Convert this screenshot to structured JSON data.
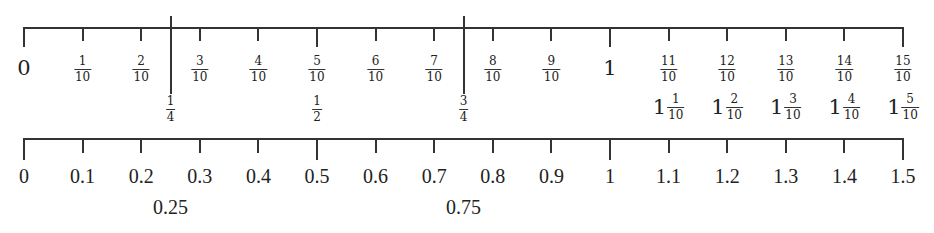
{
  "diagram": {
    "type": "number-line-comparison",
    "scale": {
      "min": 0,
      "max": 1.5,
      "x_start": 23,
      "x_end": 902
    },
    "top_line": {
      "y": 27,
      "fraction_labels": [
        {
          "value": 0,
          "whole": "0"
        },
        {
          "value": 0.1,
          "num": "1",
          "den": "10"
        },
        {
          "value": 0.2,
          "num": "2",
          "den": "10"
        },
        {
          "value": 0.3,
          "num": "3",
          "den": "10"
        },
        {
          "value": 0.4,
          "num": "4",
          "den": "10"
        },
        {
          "value": 0.5,
          "num": "5",
          "den": "10"
        },
        {
          "value": 0.6,
          "num": "6",
          "den": "10"
        },
        {
          "value": 0.7,
          "num": "7",
          "den": "10"
        },
        {
          "value": 0.8,
          "num": "8",
          "den": "10"
        },
        {
          "value": 0.9,
          "num": "9",
          "den": "10"
        },
        {
          "value": 1.0,
          "whole": "1"
        },
        {
          "value": 1.1,
          "num": "11",
          "den": "10"
        },
        {
          "value": 1.2,
          "num": "12",
          "den": "10"
        },
        {
          "value": 1.3,
          "num": "13",
          "den": "10"
        },
        {
          "value": 1.4,
          "num": "14",
          "den": "10"
        },
        {
          "value": 1.5,
          "num": "15",
          "den": "10"
        }
      ],
      "second_row_labels": [
        {
          "value": 0.25,
          "num": "1",
          "den": "4",
          "long_tick": true
        },
        {
          "value": 0.5,
          "num": "1",
          "den": "2",
          "long_tick": false
        },
        {
          "value": 0.75,
          "num": "3",
          "den": "4",
          "long_tick": true
        },
        {
          "value": 1.1,
          "whole": "1",
          "num": "1",
          "den": "10"
        },
        {
          "value": 1.2,
          "whole": "1",
          "num": "2",
          "den": "10"
        },
        {
          "value": 1.3,
          "whole": "1",
          "num": "3",
          "den": "10"
        },
        {
          "value": 1.4,
          "whole": "1",
          "num": "4",
          "den": "10"
        },
        {
          "value": 1.5,
          "whole": "1",
          "num": "5",
          "den": "10"
        }
      ]
    },
    "bottom_line": {
      "y": 138,
      "decimal_labels": [
        {
          "value": 0,
          "text": "0"
        },
        {
          "value": 0.1,
          "text": "0.1"
        },
        {
          "value": 0.2,
          "text": "0.2"
        },
        {
          "value": 0.3,
          "text": "0.3"
        },
        {
          "value": 0.4,
          "text": "0.4"
        },
        {
          "value": 0.5,
          "text": "0.5"
        },
        {
          "value": 0.6,
          "text": "0.6"
        },
        {
          "value": 0.7,
          "text": "0.7"
        },
        {
          "value": 0.8,
          "text": "0.8"
        },
        {
          "value": 0.9,
          "text": "0.9"
        },
        {
          "value": 1.0,
          "text": "1"
        },
        {
          "value": 1.1,
          "text": "1.1"
        },
        {
          "value": 1.2,
          "text": "1.2"
        },
        {
          "value": 1.3,
          "text": "1.3"
        },
        {
          "value": 1.4,
          "text": "1.4"
        },
        {
          "value": 1.5,
          "text": "1.5"
        }
      ],
      "second_row_labels": [
        {
          "value": 0.25,
          "text": "0.25"
        },
        {
          "value": 0.75,
          "text": "0.75"
        }
      ]
    },
    "colors": {
      "line": "#333333",
      "text": "#222222",
      "background": "#ffffff"
    }
  }
}
